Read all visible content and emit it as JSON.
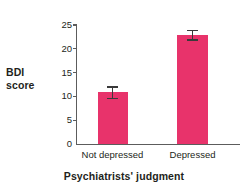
{
  "chart_data": {
    "type": "bar",
    "title": "",
    "xlabel": "Psychiatrists' judgment",
    "ylabel": "BDI score",
    "ylabel_lines": [
      "BDI",
      "score"
    ],
    "categories": [
      "Not depressed",
      "Depressed"
    ],
    "values": [
      11,
      23
    ],
    "errors": [
      1.2,
      1.0
    ],
    "error_type": "symmetric-error-bars",
    "yticks": [
      0,
      5,
      10,
      15,
      20,
      25
    ],
    "ylim": [
      0,
      25
    ],
    "grid": false,
    "legend": false,
    "bar_color": "#e8336b",
    "axis_color": "#5c5c5c",
    "error_bar_color": "#3a3a3a",
    "text_color": "#231f20",
    "background": "#ffffff"
  }
}
